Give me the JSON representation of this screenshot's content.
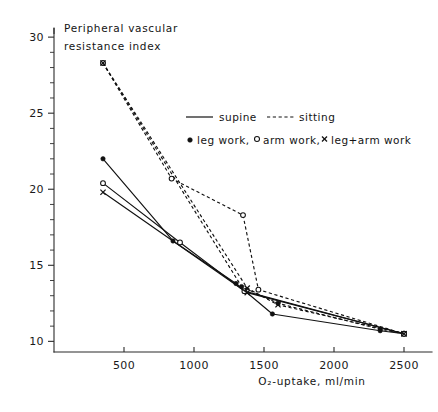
{
  "chart_data": {
    "type": "line",
    "title": "",
    "xlabel": "O₂-uptake, ml/min",
    "ylabel_line1": "Peripheral vascular",
    "ylabel_line2": "resistance index",
    "xlim": [
      0,
      2700
    ],
    "ylim": [
      9.3,
      30.6
    ],
    "xticks": [
      500,
      1000,
      1500,
      2000,
      2500
    ],
    "xtick_labels": [
      "500",
      "1000",
      "1500",
      "2000",
      "2500"
    ],
    "yticks": [
      10,
      15,
      20,
      25,
      30
    ],
    "ytick_labels": [
      "10",
      "15",
      "20",
      "25",
      "30"
    ],
    "y_minor_step": 1,
    "grid": false,
    "legend_position": "upper-right-inside",
    "legend": {
      "line_style_entries": [
        {
          "label": "supine",
          "style": "solid"
        },
        {
          "label": "sitting",
          "style": "dashed"
        }
      ],
      "marker_entries": [
        {
          "label": "leg work",
          "marker": "filled-circle",
          "separator": ","
        },
        {
          "label": "arm work",
          "marker": "open-circle",
          "separator": ","
        },
        {
          "label": "leg+arm work",
          "marker": "cross",
          "separator": ""
        }
      ]
    },
    "series": [
      {
        "name": "supine, leg work",
        "posture": "supine",
        "work": "leg work",
        "style": "solid",
        "marker": "filled-circle",
        "x": [
          350,
          850,
          1300,
          1560,
          2330,
          2500
        ],
        "y": [
          22.0,
          16.6,
          13.8,
          11.8,
          10.7,
          10.5
        ]
      },
      {
        "name": "supine, arm work",
        "posture": "supine",
        "work": "arm work",
        "style": "solid",
        "marker": "open-circle",
        "x": [
          350,
          900,
          1360,
          2500
        ],
        "y": [
          20.4,
          16.5,
          13.3,
          10.5
        ]
      },
      {
        "name": "supine, leg+arm work",
        "posture": "supine",
        "work": "leg+arm work",
        "style": "solid",
        "marker": "cross",
        "x": [
          350,
          1380,
          2500
        ],
        "y": [
          19.8,
          13.2,
          10.5
        ]
      },
      {
        "name": "sitting, leg work",
        "posture": "sitting",
        "work": "leg work",
        "style": "dashed",
        "marker": "filled-circle",
        "x": [
          350,
          1340,
          1600,
          2330,
          2500
        ],
        "y": [
          28.3,
          13.6,
          12.5,
          10.8,
          10.5
        ]
      },
      {
        "name": "sitting, arm work",
        "posture": "sitting",
        "work": "arm work",
        "style": "dashed",
        "marker": "open-circle",
        "x": [
          350,
          840,
          1350,
          1460,
          2500
        ],
        "y": [
          28.3,
          20.7,
          18.3,
          13.4,
          10.5
        ]
      },
      {
        "name": "sitting, leg+arm work",
        "posture": "sitting",
        "work": "leg+arm work",
        "style": "dashed",
        "marker": "cross",
        "x": [
          350,
          1380,
          1600,
          2500
        ],
        "y": [
          28.3,
          13.5,
          12.4,
          10.5
        ]
      }
    ]
  }
}
